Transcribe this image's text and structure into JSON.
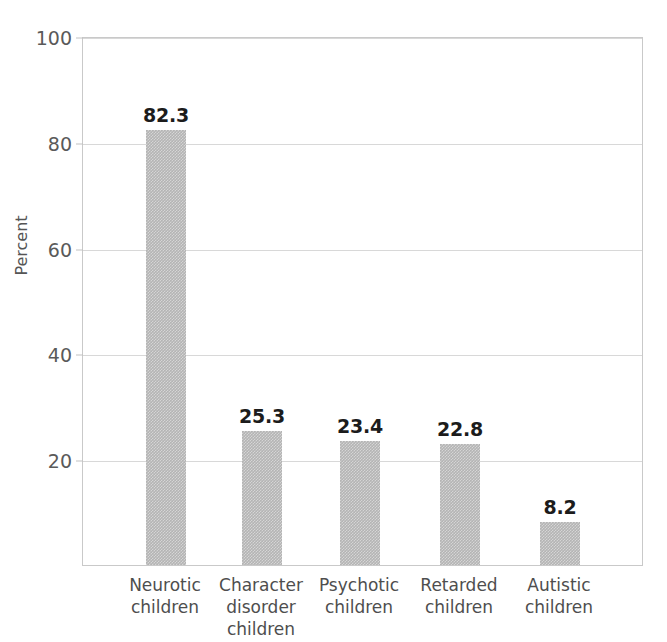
{
  "figure": {
    "top_caption_fragment": "",
    "background_color": "#ffffff"
  },
  "chart_data": {
    "type": "bar",
    "title": "",
    "xlabel": "",
    "ylabel": "Percent",
    "ylim": [
      0,
      100
    ],
    "grid": true,
    "legend": false,
    "bar_color": "#b4b4b4",
    "value_label_color": "#1c1c1c",
    "axis_color": "#c9c9c9",
    "categories": [
      "Neurotic children",
      "Character disorder children",
      "Psychotic children",
      "Retarded children",
      "Autistic children"
    ],
    "category_lines": [
      [
        "Neurotic",
        "children"
      ],
      [
        "Character",
        "disorder",
        "children"
      ],
      [
        "Psychotic",
        "children"
      ],
      [
        "Retarded",
        "children"
      ],
      [
        "Autistic",
        "children"
      ]
    ],
    "values": [
      82.3,
      25.3,
      23.4,
      22.8,
      8.2
    ],
    "value_labels": [
      "82.3",
      "25.3",
      "23.4",
      "22.8",
      "8.2"
    ],
    "ytick_values": [
      20,
      40,
      60,
      80,
      100
    ],
    "ytick_labels": [
      "20",
      "40",
      "60",
      "80",
      "100"
    ]
  }
}
